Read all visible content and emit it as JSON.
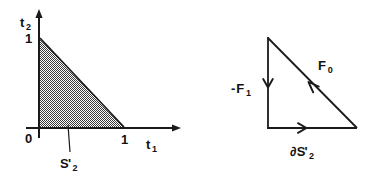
{
  "figure": {
    "background_color": "#ffffff",
    "stroke_color": "#1a1a1a",
    "shade_color": "#808080",
    "width": 373,
    "height": 175
  },
  "left_panel": {
    "name": "simplex-region-plot",
    "axes": {
      "y_axis_label_base": "t",
      "y_axis_label_sub": "2",
      "x_axis_label_base": "t",
      "x_axis_label_sub": "1",
      "origin_label": "0",
      "y_tick_label": "1",
      "x_tick_label": "1"
    },
    "region": {
      "label_base": "S",
      "label_prime": "'",
      "label_sub": "2",
      "description": "shaded triangular region",
      "vertices": [
        [
          0,
          0
        ],
        [
          1,
          0
        ],
        [
          0,
          1
        ]
      ]
    }
  },
  "right_panel": {
    "name": "oriented-boundary-diagram",
    "edges": [
      {
        "name": "left-edge",
        "label_minus": "-",
        "label_base": "F",
        "label_sub": "1",
        "direction": "downward"
      },
      {
        "name": "hypotenuse-edge",
        "label_base": "F",
        "label_sub": "0",
        "direction": "up-left"
      },
      {
        "name": "bottom-edge",
        "label_partial": "∂",
        "label_base": "S",
        "label_prime": "'",
        "label_sub": "2",
        "direction": "rightward"
      }
    ]
  }
}
